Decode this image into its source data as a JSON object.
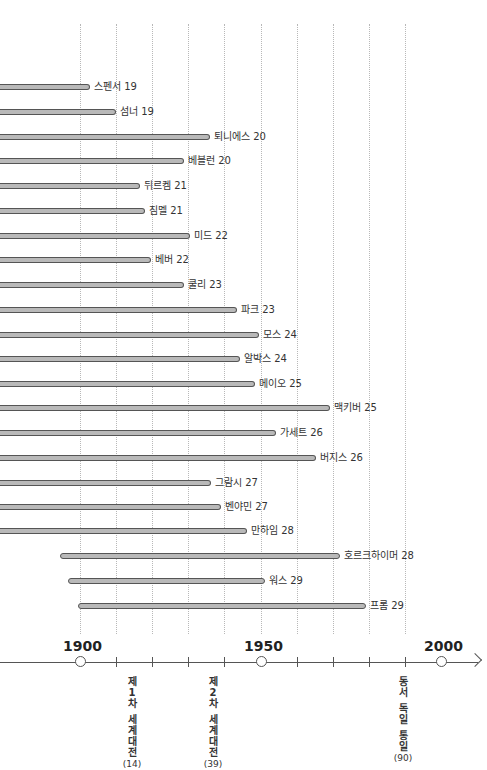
{
  "chart_data": {
    "type": "timeline",
    "title": "",
    "x_axis": {
      "range": [
        1880,
        2010
      ],
      "major_labels": [
        "1900",
        "1950",
        "2000"
      ],
      "major_values": [
        1900,
        1950,
        2000
      ],
      "minor_ticks": [
        1910,
        1920,
        1930,
        1940,
        1960,
        1970,
        1980,
        1990
      ],
      "gridlines": [
        1900,
        1910,
        1920,
        1930,
        1940,
        1950,
        1960,
        1970,
        1980,
        1990
      ],
      "grid_style": "dotted"
    },
    "px_per_year": 3.61,
    "origin_year_px": 77,
    "bars": [
      {
        "label": "스펜서 19",
        "start": null,
        "end_x": 90,
        "y": 87
      },
      {
        "label": "섬너 19",
        "start": null,
        "end_x": 116,
        "y": 112
      },
      {
        "label": "퇴니에스 20",
        "start": null,
        "end_x": 210,
        "y": 137
      },
      {
        "label": "베블런 20",
        "start": null,
        "end_x": 184,
        "y": 161
      },
      {
        "label": "뒤르켐 21",
        "start": null,
        "end_x": 140,
        "y": 186
      },
      {
        "label": "짐멜 21",
        "start": null,
        "end_x": 145,
        "y": 211
      },
      {
        "label": "미드 22",
        "start": null,
        "end_x": 190,
        "y": 236
      },
      {
        "label": "베버 22",
        "start": null,
        "end_x": 151,
        "y": 260
      },
      {
        "label": "쿨리 23",
        "start": null,
        "end_x": 184,
        "y": 285
      },
      {
        "label": "파크 23",
        "start": null,
        "end_x": 237,
        "y": 310
      },
      {
        "label": "모스 24",
        "start": null,
        "end_x": 259,
        "y": 335
      },
      {
        "label": "알박스 24",
        "start": null,
        "end_x": 240,
        "y": 359
      },
      {
        "label": "메이오 25",
        "start": null,
        "end_x": 255,
        "y": 384
      },
      {
        "label": "맥키버 25",
        "start": null,
        "end_x": 330,
        "y": 408
      },
      {
        "label": "가세트 26",
        "start": null,
        "end_x": 276,
        "y": 433
      },
      {
        "label": "버지스 26",
        "start": null,
        "end_x": 316,
        "y": 458
      },
      {
        "label": "그람시 27",
        "start": null,
        "end_x": 211,
        "y": 483
      },
      {
        "label": "벤야민 27",
        "start": null,
        "end_x": 221,
        "y": 507
      },
      {
        "label": "만하임 28",
        "start": null,
        "end_x": 247,
        "y": 531
      },
      {
        "label": "호르크하이머 28",
        "start_x": 60,
        "end_x": 340,
        "y": 556
      },
      {
        "label": "워스 29",
        "start_x": 68,
        "end_x": 265,
        "y": 581
      },
      {
        "label": "프롬 29",
        "start_x": 78,
        "end_x": 366,
        "y": 606
      }
    ],
    "events": [
      {
        "chars": [
          "제",
          "1",
          "차",
          "",
          "세",
          "계",
          "대",
          "전"
        ],
        "year_label": "(14)",
        "year": 1914,
        "x": 132
      },
      {
        "chars": [
          "제",
          "2",
          "차",
          "",
          "세",
          "계",
          "대",
          "전"
        ],
        "year_label": "(39)",
        "year": 1939,
        "x": 213
      },
      {
        "chars": [
          "동",
          "서",
          "",
          "독",
          "일",
          "",
          "통",
          "일"
        ],
        "year_label": "(90)",
        "year": 1990,
        "x": 403
      }
    ]
  },
  "colors": {
    "bar_fill": "#b9b9b9",
    "bar_border": "#555555",
    "grid": "#b8b8b8",
    "axis": "#555555"
  }
}
